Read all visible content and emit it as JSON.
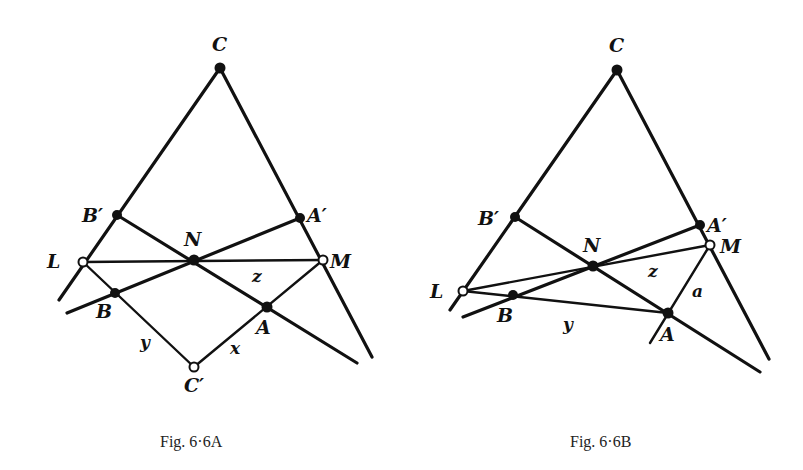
{
  "figures": [
    {
      "id": "fig-6-6A",
      "caption": "Fig. 6·6A",
      "labels": {
        "C": "C",
        "B_prime": "B′",
        "A_prime": "A′",
        "N": "N",
        "L": "L",
        "M": "M",
        "B": "B",
        "A": "A",
        "C_prime": "C′",
        "x": "x",
        "y": "y",
        "z": "z"
      },
      "points": {
        "C": {
          "x": 220,
          "y": 68,
          "style": "filled"
        },
        "B_prime": {
          "x": 117,
          "y": 215,
          "style": "filled"
        },
        "A_prime": {
          "x": 300,
          "y": 218,
          "style": "filled"
        },
        "N": {
          "x": 194,
          "y": 260,
          "style": "filled"
        },
        "L": {
          "x": 83,
          "y": 262,
          "style": "open"
        },
        "M": {
          "x": 323,
          "y": 260,
          "style": "open"
        },
        "B": {
          "x": 115,
          "y": 293,
          "style": "filled"
        },
        "A": {
          "x": 267,
          "y": 307,
          "style": "filled"
        },
        "C_prime": {
          "x": 194,
          "y": 367,
          "style": "open"
        }
      }
    },
    {
      "id": "fig-6-6B",
      "caption": "Fig. 6·6B",
      "labels": {
        "C": "C",
        "B_prime": "B′",
        "A_prime": "A′",
        "N": "N",
        "L": "L",
        "M": "M",
        "B": "B",
        "A": "A",
        "y": "y",
        "z": "z",
        "a": "a"
      },
      "points": {
        "C": {
          "x": 617,
          "y": 70,
          "style": "filled"
        },
        "B_prime": {
          "x": 515,
          "y": 217,
          "style": "filled"
        },
        "A_prime": {
          "x": 700,
          "y": 225,
          "style": "filled"
        },
        "M": {
          "x": 710,
          "y": 245,
          "style": "open"
        },
        "N": {
          "x": 593,
          "y": 266,
          "style": "filled"
        },
        "L": {
          "x": 463,
          "y": 291,
          "style": "open"
        },
        "B": {
          "x": 513,
          "y": 295,
          "style": "filled"
        },
        "A": {
          "x": 668,
          "y": 313,
          "style": "filled"
        }
      }
    }
  ]
}
